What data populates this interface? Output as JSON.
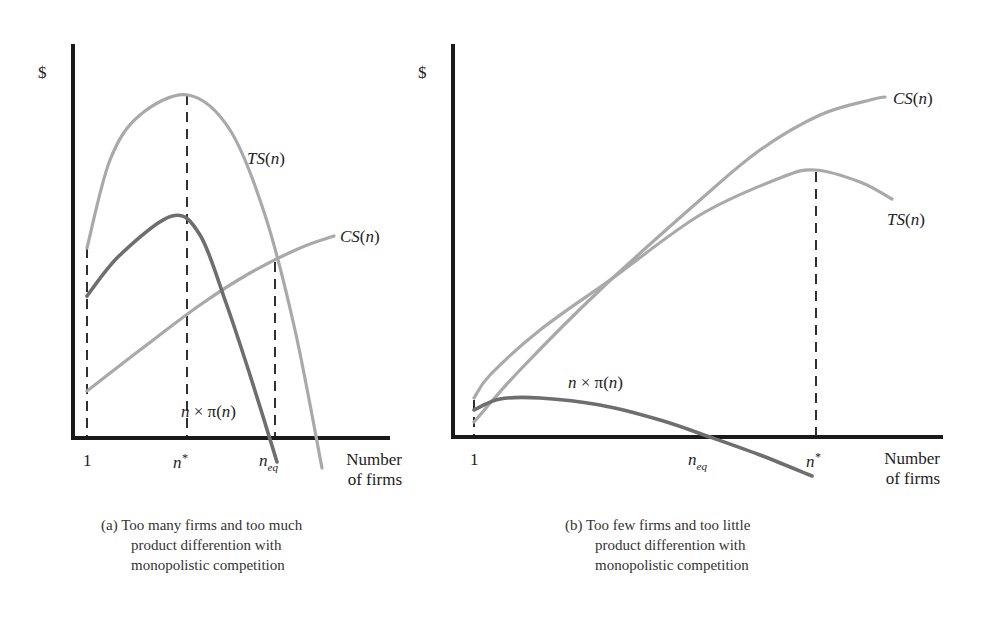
{
  "chart_data": [
    {
      "id": "a",
      "type": "line",
      "title": "(a) Too many firms and too much product differention with monopolistic competition",
      "xlabel": "Number of firms",
      "ylabel": "$",
      "grid": false,
      "x_ticks": [
        "1",
        "n*",
        "n_eq"
      ],
      "series": [
        {
          "name": "TS(n)",
          "color": "#a9a9a9",
          "points": [
            [
              87,
              248
            ],
            [
              110,
              160
            ],
            [
              140,
              115
            ],
            [
              188,
              95
            ],
            [
              230,
              130
            ],
            [
              265,
              215
            ],
            [
              295,
              330
            ],
            [
              322,
              468
            ]
          ]
        },
        {
          "name": "n × π(n)",
          "color": "#6e6e6e",
          "points": [
            [
              87,
              296
            ],
            [
              120,
              255
            ],
            [
              172,
              216
            ],
            [
              200,
              235
            ],
            [
              225,
              300
            ],
            [
              250,
              375
            ],
            [
              277,
              462
            ]
          ]
        },
        {
          "name": "CS(n)",
          "color": "#a9a9a9",
          "points": [
            [
              87,
              391
            ],
            [
              140,
              350
            ],
            [
              200,
              305
            ],
            [
              250,
              273
            ],
            [
              300,
              248
            ],
            [
              334,
              236
            ]
          ]
        }
      ],
      "annotations": [
        {
          "text": "$",
          "role": "y-axis-label"
        },
        {
          "text": "TS(n)",
          "role": "curve-label"
        },
        {
          "text": "CS(n)",
          "role": "curve-label"
        },
        {
          "text": "n × π(n)",
          "role": "curve-label"
        }
      ]
    },
    {
      "id": "b",
      "type": "line",
      "title": "(b) Too few firms and too little product differention with monopolistic competition",
      "xlabel": "Number of firms",
      "ylabel": "$",
      "grid": false,
      "x_ticks": [
        "1",
        "n_eq",
        "n*"
      ],
      "series": [
        {
          "name": "CS(n)",
          "color": "#a9a9a9",
          "points": [
            [
              474,
              422
            ],
            [
              520,
              370
            ],
            [
              600,
              290
            ],
            [
              700,
              200
            ],
            [
              760,
              150
            ],
            [
              820,
              115
            ],
            [
              870,
              100
            ],
            [
              885,
              97
            ]
          ]
        },
        {
          "name": "TS(n)",
          "color": "#a9a9a9",
          "points": [
            [
              474,
              398
            ],
            [
              490,
              375
            ],
            [
              540,
              330
            ],
            [
              610,
              280
            ],
            [
              700,
              215
            ],
            [
              780,
              178
            ],
            [
              815,
              170
            ],
            [
              860,
              182
            ],
            [
              892,
              199
            ]
          ]
        },
        {
          "name": "n × π(n)",
          "color": "#6e6e6e",
          "points": [
            [
              474,
              410
            ],
            [
              500,
              399
            ],
            [
              540,
              398
            ],
            [
              600,
              405
            ],
            [
              660,
              420
            ],
            [
              710,
              437
            ],
            [
              760,
              455
            ],
            [
              812,
              476
            ]
          ]
        }
      ],
      "annotations": [
        {
          "text": "$",
          "role": "y-axis-label"
        },
        {
          "text": "CS(n)",
          "role": "curve-label"
        },
        {
          "text": "TS(n)",
          "role": "curve-label"
        },
        {
          "text": "n × π(n)",
          "role": "curve-label"
        }
      ]
    }
  ],
  "labels": {
    "dollar": "$",
    "one": "1",
    "n": "n",
    "star": "*",
    "eq": "eq",
    "ts_fn": "TS",
    "cs_fn": "CS",
    "paren_n_open": "(",
    "paren_n_close": ")",
    "times_pi": " × π(",
    "xlabel_line1": "Number",
    "xlabel_line2": "of firms"
  },
  "captions": {
    "a": {
      "line1": "(a) Too many firms and too much",
      "line2": "product differention with",
      "line3": "monopolistic competition"
    },
    "b": {
      "line1": "(b) Too few firms and too little",
      "line2": "product differention with",
      "line3": "monopolistic competition"
    }
  }
}
